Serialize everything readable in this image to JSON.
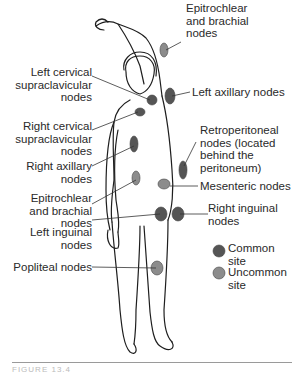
{
  "labels": {
    "epitrochlear_top": "Epitrochlear\nand brachial\nnodes",
    "left_cervical": "Left cervical\nsupraclavicular\nnodes",
    "left_axillary": "Left axillary nodes",
    "right_cervical": "Right cervical\nsupraclavicular\nnodes",
    "retroperitoneal": "Retroperitoneal\nnodes (located\nbehind the\nperitoneum)",
    "right_axillary": "Right axillary\nnodes",
    "mesenteric": "Mesenteric nodes",
    "epitrochlear_side": "Epitrochlear\nand brachial\nnodes",
    "right_inguinal": "Right inguinal\nnodes",
    "left_inguinal": "Left inguinal\nnodes",
    "popliteal": "Popliteal nodes"
  },
  "legend": {
    "common": "Common\nsite",
    "uncommon": "Uncommon\nsite",
    "common_color": "#555555",
    "uncommon_color": "#8c8c8c"
  },
  "caption": "FIGURE 13.4"
}
